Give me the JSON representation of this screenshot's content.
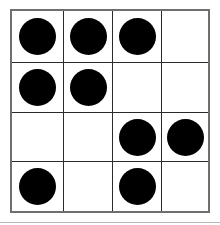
{
  "figure": {
    "background_color": "#ffffff",
    "grid_line_color": "#2b2b2b",
    "border_color": "#6f6f6f",
    "dot_color": "#000000",
    "rows": 4,
    "columns": 4,
    "dot_count": 9,
    "empty_count": 7
  },
  "grid": {
    "cells": [
      {
        "row": 1,
        "col": 1,
        "filled": true,
        "label": "row-1-col-1-filled"
      },
      {
        "row": 1,
        "col": 2,
        "filled": true,
        "label": "row-1-col-2-filled"
      },
      {
        "row": 1,
        "col": 3,
        "filled": true,
        "label": "row-1-col-3-filled"
      },
      {
        "row": 1,
        "col": 4,
        "filled": false,
        "label": "row-1-col-4-empty"
      },
      {
        "row": 2,
        "col": 1,
        "filled": true,
        "label": "row-2-col-1-filled"
      },
      {
        "row": 2,
        "col": 2,
        "filled": true,
        "label": "row-2-col-2-filled"
      },
      {
        "row": 2,
        "col": 3,
        "filled": false,
        "label": "row-2-col-3-empty"
      },
      {
        "row": 2,
        "col": 4,
        "filled": false,
        "label": "row-2-col-4-empty"
      },
      {
        "row": 3,
        "col": 1,
        "filled": false,
        "label": "row-3-col-1-empty"
      },
      {
        "row": 3,
        "col": 2,
        "filled": false,
        "label": "row-3-col-2-empty"
      },
      {
        "row": 3,
        "col": 3,
        "filled": true,
        "label": "row-3-col-3-filled"
      },
      {
        "row": 3,
        "col": 4,
        "filled": true,
        "label": "row-3-col-4-filled"
      },
      {
        "row": 4,
        "col": 1,
        "filled": true,
        "label": "row-4-col-1-filled"
      },
      {
        "row": 4,
        "col": 2,
        "filled": false,
        "label": "row-4-col-2-empty"
      },
      {
        "row": 4,
        "col": 3,
        "filled": true,
        "label": "row-4-col-3-filled"
      },
      {
        "row": 4,
        "col": 4,
        "filled": false,
        "label": "row-4-col-4-empty"
      }
    ]
  }
}
